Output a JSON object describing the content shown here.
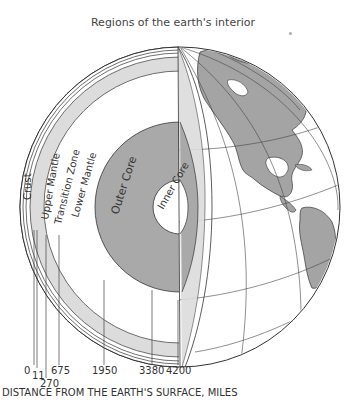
{
  "title": "Regions of the earth's interior",
  "layers": [
    {
      "name": "Crust",
      "label": "Crust"
    },
    {
      "name": "Upper Mantle",
      "label": "Upper Mantle"
    },
    {
      "name": "Transition Zone",
      "label": "Transition Zone"
    },
    {
      "name": "Lower Mantle",
      "label": "Lower Mantle"
    },
    {
      "name": "Outer Core",
      "label": "Outer Core"
    },
    {
      "name": "Inner Core",
      "label": "Inner Core"
    }
  ],
  "ticks": [
    {
      "value": "0"
    },
    {
      "value": "11"
    },
    {
      "value": "270"
    },
    {
      "value": "675"
    },
    {
      "value": "1950"
    },
    {
      "value": "3380"
    },
    {
      "value": "4200"
    }
  ],
  "axis_label": "DISTANCE FROM THE EARTH'S SURFACE, MILES",
  "colors": {
    "core_gray": "#a9a9a9",
    "band_gray": "#dcdcdc",
    "land_gray": "#a4a4a4",
    "line": "#333333"
  }
}
